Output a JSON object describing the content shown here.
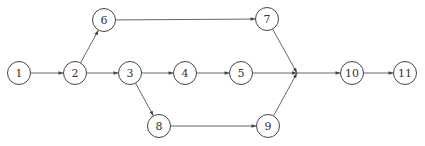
{
  "diagram": {
    "type": "network-diagram",
    "node_radius": 11.5,
    "nodes": [
      {
        "id": "1",
        "label": "1",
        "x": 19,
        "y": 73
      },
      {
        "id": "2",
        "label": "2",
        "x": 75,
        "y": 73
      },
      {
        "id": "3",
        "label": "3",
        "x": 130,
        "y": 73
      },
      {
        "id": "4",
        "label": "4",
        "x": 185,
        "y": 73
      },
      {
        "id": "5",
        "label": "5",
        "x": 241,
        "y": 73
      },
      {
        "id": "6",
        "label": "6",
        "x": 104,
        "y": 20
      },
      {
        "id": "7",
        "label": "7",
        "x": 267,
        "y": 19
      },
      {
        "id": "8",
        "label": "8",
        "x": 159,
        "y": 126
      },
      {
        "id": "9",
        "label": "9",
        "x": 268,
        "y": 126
      },
      {
        "id": "10",
        "label": "10",
        "x": 352,
        "y": 73
      },
      {
        "id": "11",
        "label": "11",
        "x": 405,
        "y": 73
      }
    ],
    "junction": {
      "x": 297,
      "y": 73
    },
    "edges": [
      {
        "from": "1",
        "to": "2"
      },
      {
        "from": "2",
        "to": "6"
      },
      {
        "from": "2",
        "to": "3"
      },
      {
        "from": "3",
        "to": "4"
      },
      {
        "from": "3",
        "to": "8"
      },
      {
        "from": "4",
        "to": "5"
      },
      {
        "from": "6",
        "to": "7"
      },
      {
        "from": "8",
        "to": "9"
      },
      {
        "from": "7",
        "to": "junction"
      },
      {
        "from": "5",
        "to": "junction"
      },
      {
        "from": "9",
        "to": "junction"
      },
      {
        "from": "junction",
        "to": "10"
      },
      {
        "from": "10",
        "to": "11"
      }
    ]
  }
}
